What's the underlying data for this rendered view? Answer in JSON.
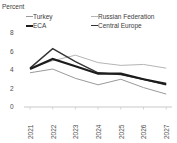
{
  "chart_data": {
    "type": "line",
    "title": "Percent",
    "x": [
      "2021",
      "2022",
      "2023",
      "2024",
      "2025",
      "2026",
      "2027"
    ],
    "yticks": [
      0,
      2,
      4,
      6,
      8
    ],
    "ylim": [
      0,
      8
    ],
    "grid": false,
    "legend_position": "top",
    "axis_color": "#c9c9c9",
    "tick_text_color": "#4d4d4d",
    "series": [
      {
        "name": "Turkey",
        "color": "#9a9a9a",
        "width": 1,
        "values": [
          3.7,
          4.1,
          3.1,
          2.4,
          3.0,
          2.1,
          1.4
        ]
      },
      {
        "name": "ECA",
        "color": "#1c1c1c",
        "width": 2.2,
        "values": [
          4.1,
          5.2,
          4.4,
          3.6,
          3.6,
          3.0,
          2.5
        ]
      },
      {
        "name": "Russian Federation",
        "color": "#b5b5b5",
        "width": 1,
        "values": [
          4.2,
          5.0,
          5.6,
          4.8,
          4.5,
          4.6,
          4.2
        ]
      },
      {
        "name": "Central Europe",
        "color": "#333333",
        "width": 1.4,
        "values": [
          4.2,
          6.3,
          4.9,
          3.7,
          3.5,
          3.0,
          2.4
        ]
      }
    ]
  }
}
